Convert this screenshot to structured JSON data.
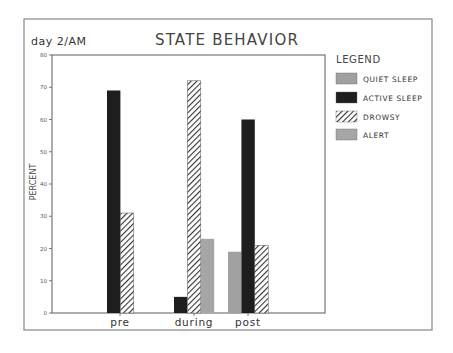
{
  "chart_data": {
    "type": "bar",
    "title": "STATE BEHAVIOR",
    "subtitle": "day 2/AM",
    "xlabel": "",
    "ylabel": "PERCENT",
    "ylim": [
      0,
      80
    ],
    "yticks": [
      0,
      10,
      20,
      30,
      40,
      50,
      60,
      70,
      80
    ],
    "grid": false,
    "legend_position": "right",
    "legend_title": "LEGEND",
    "categories": [
      "pre",
      "during",
      "post"
    ],
    "series": [
      {
        "name": "QUIET SLEEP",
        "values": [
          0,
          0,
          19
        ],
        "color": "#a0a0a0",
        "pattern": "solid"
      },
      {
        "name": "ACTIVE SLEEP",
        "values": [
          69,
          5,
          60
        ],
        "color": "#1e1e1e",
        "pattern": "solid"
      },
      {
        "name": "DROWSY",
        "values": [
          31,
          72,
          21
        ],
        "color": "#333333",
        "pattern": "diagonal-hatch"
      },
      {
        "name": "ALERT",
        "values": [
          0,
          23,
          0
        ],
        "color": "#a6a6a6",
        "pattern": "solid"
      }
    ]
  }
}
